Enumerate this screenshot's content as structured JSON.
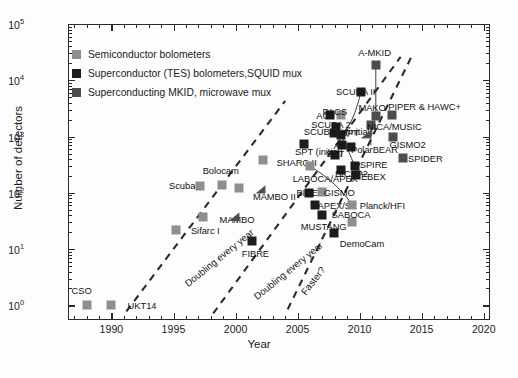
{
  "chart_data": {
    "type": "scatter",
    "title": "",
    "xlabel": "Year",
    "ylabel": "Number of detectors",
    "xlim": [
      1986.5,
      2020.5
    ],
    "ylim": [
      0.55,
      100000
    ],
    "yscale": "log",
    "grid": false,
    "xticks": [
      "1990",
      "1995",
      "2000",
      "2005",
      "2010",
      "2015",
      "2020"
    ],
    "xtick_values": [
      1990,
      1995,
      2000,
      2005,
      2010,
      2015,
      2020
    ],
    "yticks": [
      "10^0",
      "10^1",
      "10^2",
      "10^3",
      "10^4",
      "10^5"
    ],
    "ytick_values": [
      1,
      10,
      100,
      1000,
      10000,
      100000
    ],
    "legend_position": "upper left",
    "legend": [
      {
        "label": "Semiconductor bolometers",
        "color": "#8e8e8e",
        "key": "semiconductor"
      },
      {
        "label": "Superconductor (TES) bolometers,SQUID mux",
        "color": "#1c1c1c",
        "key": "tes"
      },
      {
        "label": "Superconducting MKID, microwave mux",
        "color": "#4d4d4d",
        "key": "mkid"
      }
    ],
    "annotations": [
      {
        "text": "Doubling every year",
        "x": 1996.0,
        "y": 3.0,
        "angle": -39
      },
      {
        "text": "Doubling every year",
        "x": 2001.6,
        "y": 1.7,
        "angle": -39
      },
      {
        "text": "Faster?",
        "x": 2005.4,
        "y": 2.0,
        "angle": -52
      }
    ],
    "points": [
      {
        "label": "CSO",
        "x": 1988.0,
        "y": 1,
        "series": "semiconductor",
        "lx": 1987.6,
        "ly": 1.85,
        "lanchor": "center"
      },
      {
        "label": "UKT14",
        "x": 1990.0,
        "y": 1,
        "series": "semiconductor",
        "lx": 1991.3,
        "ly": 1.0,
        "lanchor": "left"
      },
      {
        "label": "Sifarc I",
        "x": 1995.2,
        "y": 22,
        "series": "semiconductor",
        "lx": 1996.4,
        "ly": 22,
        "lanchor": "left"
      },
      {
        "label": "MAMBO",
        "x": 1997.4,
        "y": 37,
        "series": "semiconductor",
        "lx": 1998.7,
        "ly": 34,
        "lanchor": "left"
      },
      {
        "label": "Scuba",
        "x": 1997.1,
        "y": 135,
        "series": "semiconductor",
        "lx": 1995.7,
        "ly": 140,
        "lanchor": "center"
      },
      {
        "label": "Bolocam",
        "x": 1998.9,
        "y": 140,
        "series": "semiconductor",
        "lx": 1998.8,
        "ly": 260,
        "lanchor": "center"
      },
      {
        "label": "MAMBO II",
        "x": 2000.3,
        "y": 120,
        "series": "semiconductor",
        "lx": 2001.4,
        "ly": 88,
        "lanchor": "left"
      },
      {
        "label": "SHARC II",
        "x": 2002.2,
        "y": 380,
        "series": "semiconductor",
        "lx": 2003.3,
        "ly": 360,
        "lanchor": "left"
      },
      {
        "label": "FIBRE",
        "x": 2001.3,
        "y": 14,
        "series": "tes",
        "lx": 2001.6,
        "ly": 8.6,
        "lanchor": "center"
      },
      {
        "label": "LABOCA/APEX",
        "x": 2006.0,
        "y": 300,
        "series": "semiconductor",
        "lx": 2004.6,
        "ly": 185,
        "lanchor": "left"
      },
      {
        "label": "SPT (initial)",
        "x": 2005.5,
        "y": 750,
        "series": "tes",
        "lx": 2004.8,
        "ly": 560,
        "lanchor": "left"
      },
      {
        "label": "BICEP",
        "x": 2005.9,
        "y": 100,
        "series": "tes",
        "lx": 2004.9,
        "ly": 105,
        "lanchor": "left"
      },
      {
        "label": "GISMO",
        "x": 2007.0,
        "y": 105,
        "series": "semiconductor",
        "lx": 2007.1,
        "ly": 105,
        "lanchor": "left"
      },
      {
        "label": "APEX/SZ",
        "x": 2006.4,
        "y": 62,
        "series": "tes",
        "lx": 2006.6,
        "ly": 61,
        "lanchor": "left"
      },
      {
        "label": "MUSTANG",
        "x": 2007.0,
        "y": 40,
        "series": "tes",
        "lx": 2007.1,
        "ly": 26,
        "lanchor": "center"
      },
      {
        "label": "DemoCam",
        "x": 2007.9,
        "y": 19,
        "series": "tes",
        "lx": 2008.4,
        "ly": 13,
        "lanchor": "left"
      },
      {
        "label": "SABOCA",
        "x": 2009.4,
        "y": 30,
        "series": "semiconductor",
        "lx": 2009.3,
        "ly": 42,
        "lanchor": "center"
      },
      {
        "label": "Planck/HFI",
        "x": 2009.4,
        "y": 62,
        "series": "semiconductor",
        "lx": 2010.0,
        "ly": 62,
        "lanchor": "left"
      },
      {
        "label": "SCUBA II (initial)",
        "x": 2007.9,
        "y": 1150,
        "series": "tes",
        "lx": 2005.5,
        "ly": 1250,
        "lanchor": "left"
      },
      {
        "label": "SCUBA 2",
        "x": 2008.1,
        "y": 1500,
        "series": "tes",
        "lx": 2006.1,
        "ly": 1650,
        "lanchor": "left"
      },
      {
        "label": "ACT",
        "x": 2007.6,
        "y": 2400,
        "series": "tes",
        "lx": 2006.5,
        "ly": 2400,
        "lanchor": "left"
      },
      {
        "label": "PACS",
        "x": 2008.5,
        "y": 2400,
        "series": "semiconductor",
        "lx": 2008.0,
        "ly": 2900,
        "lanchor": "center"
      },
      {
        "label": "SPT",
        "x": 2008.5,
        "y": 1050,
        "series": "tes",
        "lx": 2008.5,
        "ly": 1200,
        "lanchor": "left"
      },
      {
        "label": "ACT",
        "x": 2008.6,
        "y": 700,
        "series": "tes",
        "lx": 2007.9,
        "ly": 700,
        "lanchor": "left"
      },
      {
        "label": "SPT",
        "x": 2008.0,
        "y": 480,
        "series": "tes",
        "lx": 2007.3,
        "ly": 520,
        "lanchor": "left"
      },
      {
        "label": "BICEP2",
        "x": 2008.5,
        "y": 260,
        "series": "tes",
        "lx": 2008.0,
        "ly": 230,
        "lanchor": "left"
      },
      {
        "label": "PolarBEAR",
        "x": 2009.3,
        "y": 650,
        "series": "tes",
        "lx": 2009.3,
        "ly": 610,
        "lanchor": "left"
      },
      {
        "label": "SPIRE",
        "x": 2009.6,
        "y": 300,
        "series": "tes",
        "lx": 2010.0,
        "ly": 330,
        "lanchor": "left"
      },
      {
        "label": "EBEX",
        "x": 2009.7,
        "y": 210,
        "series": "tes",
        "lx": 2010.1,
        "ly": 200,
        "lanchor": "left"
      },
      {
        "label": "SCUBA II",
        "x": 2010.1,
        "y": 6200,
        "series": "tes",
        "lx": 2008.1,
        "ly": 6400,
        "lanchor": "left"
      },
      {
        "label": "A-MKID",
        "x": 2011.3,
        "y": 19000,
        "series": "mkid",
        "lx": 2011.2,
        "ly": 32000,
        "lanchor": "center"
      },
      {
        "label": "MAKO",
        "x": 2011.3,
        "y": 2300,
        "series": "mkid",
        "lx": 2011.0,
        "ly": 3400,
        "lanchor": "center"
      },
      {
        "label": "NICA/MUSIC",
        "x": 2010.9,
        "y": 1600,
        "series": "mkid",
        "lx": 2010.6,
        "ly": 1550,
        "lanchor": "left"
      },
      {
        "label": "PIPER & HAWC+",
        "x": 2012.6,
        "y": 2400,
        "series": "mkid",
        "lx": 2012.3,
        "ly": 3500,
        "lanchor": "left"
      },
      {
        "label": "GISMO2",
        "x": 2012.7,
        "y": 1000,
        "series": "mkid",
        "lx": 2012.4,
        "ly": 740,
        "lanchor": "left"
      },
      {
        "label": "SPIDER",
        "x": 2013.5,
        "y": 420,
        "series": "mkid",
        "lx": 2013.9,
        "ly": 420,
        "lanchor": "left"
      }
    ],
    "extra_markers": [
      {
        "x": 2010.5,
        "y": 1100,
        "series": "mkid",
        "shape": "wedge"
      },
      {
        "x": 2002.0,
        "y": 115,
        "series": "mkid",
        "shape": "wedge"
      },
      {
        "x": 1999.9,
        "y": 38,
        "series": "mkid",
        "shape": "wedge"
      }
    ],
    "trend_lines": [
      {
        "name": "doubling-1",
        "x1": 1991.2,
        "y1": 0.78,
        "x2": 2004.0,
        "y2": 4300,
        "style": "dashed"
      },
      {
        "name": "doubling-2",
        "x1": 1998.2,
        "y1": 0.72,
        "x2": 2013.3,
        "y2": 26000,
        "style": "dashed"
      },
      {
        "name": "faster",
        "x1": 2004.2,
        "y1": 0.85,
        "x2": 2014.3,
        "y2": 30000,
        "style": "dashed"
      }
    ]
  },
  "colors": {
    "semiconductor": "#8e8e8e",
    "tes": "#1c1c1c",
    "mkid": "#4d4d4d",
    "axis": "#2a2a2a",
    "text": "#1b1b1b",
    "background": "#fdfdfd"
  }
}
